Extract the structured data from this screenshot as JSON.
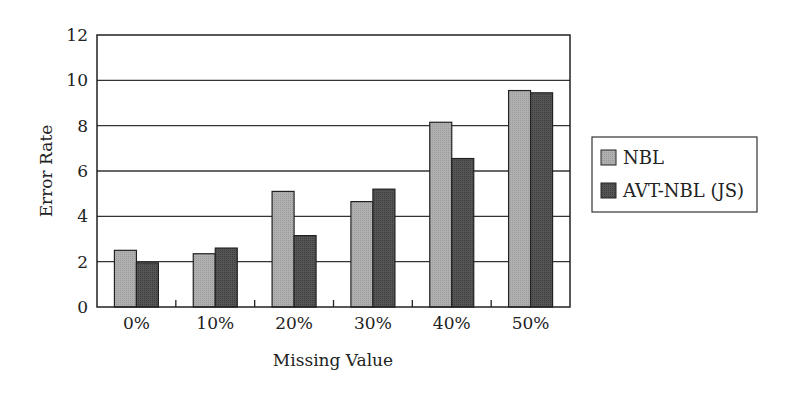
{
  "chart_data": {
    "type": "bar",
    "title": "",
    "xlabel": "Missing Value",
    "ylabel": "Error Rate",
    "ylim": [
      0,
      12
    ],
    "yticks": [
      0,
      2,
      4,
      6,
      8,
      10,
      12
    ],
    "grid": true,
    "legend_position": "right",
    "categories": [
      "0%",
      "10%",
      "20%",
      "30%",
      "40%",
      "50%"
    ],
    "series": [
      {
        "name": "NBL",
        "color": "#a8a8a8",
        "values": [
          2.5,
          2.35,
          5.1,
          4.65,
          8.15,
          9.55
        ]
      },
      {
        "name": "AVT-NBL (JS)",
        "color": "#4a4a4a",
        "values": [
          1.95,
          2.6,
          3.15,
          5.2,
          6.55,
          9.45
        ]
      }
    ]
  }
}
